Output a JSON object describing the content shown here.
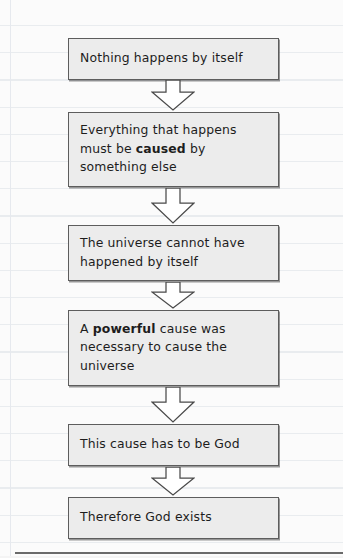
{
  "page": {
    "type": "handwritten-style flowchart on ruled notebook paper",
    "width": 343,
    "height": 558,
    "background_color": "#fbfbfb",
    "rule_line_color": "#e9ecef",
    "margin_line_color": "#e6e9ee",
    "bottom_rule_color": "#6a6a6a"
  },
  "chart_data": {
    "type": "diagram",
    "subtype": "vertical-flowchart",
    "title": "",
    "node_fill": "#ececec",
    "node_border": "#5d5d5d",
    "arrow_fill": "#ffffff",
    "arrow_stroke": "#4a4a4a",
    "nodes": [
      {
        "id": "n1",
        "text": "Nothing happens by itself",
        "segments": [
          {
            "text": "Nothing happens by itself",
            "bold": false
          }
        ],
        "x": 68,
        "y": 38,
        "width": 211,
        "height": 42
      },
      {
        "id": "n2",
        "text": "Everything that happens must be caused by something else",
        "segments": [
          {
            "text": "Everything that happens\nmust be ",
            "bold": false
          },
          {
            "text": "caused",
            "bold": true
          },
          {
            "text": " by\nsomething else",
            "bold": false
          }
        ],
        "x": 68,
        "y": 112,
        "width": 211,
        "height": 75
      },
      {
        "id": "n3",
        "text": "The universe cannot have happened by itself",
        "segments": [
          {
            "text": "The universe cannot have\nhappened by itself",
            "bold": false
          }
        ],
        "x": 68,
        "y": 225,
        "width": 211,
        "height": 56
      },
      {
        "id": "n4",
        "text": "A powerful cause was necessary to cause the universe",
        "segments": [
          {
            "text": "A ",
            "bold": false
          },
          {
            "text": "powerful",
            "bold": true
          },
          {
            "text": " cause was\nnecessary to cause the\nuniverse",
            "bold": false
          }
        ],
        "x": 68,
        "y": 310,
        "width": 211,
        "height": 76
      },
      {
        "id": "n5",
        "text": "This cause has to be God",
        "segments": [
          {
            "text": "This cause has to be God",
            "bold": false
          }
        ],
        "x": 68,
        "y": 424,
        "width": 211,
        "height": 42
      },
      {
        "id": "n6",
        "text": "Therefore God exists",
        "segments": [
          {
            "text": "Therefore God exists",
            "bold": false
          }
        ],
        "x": 68,
        "y": 497,
        "width": 211,
        "height": 42
      }
    ],
    "arrows": [
      {
        "id": "a1",
        "from": "n1",
        "to": "n2",
        "direction": "down",
        "x": 151,
        "y": 80,
        "width": 44,
        "height": 31
      },
      {
        "id": "a2",
        "from": "n2",
        "to": "n3",
        "direction": "down",
        "x": 151,
        "y": 188,
        "width": 44,
        "height": 36
      },
      {
        "id": "a3",
        "from": "n3",
        "to": "n4",
        "direction": "down",
        "x": 151,
        "y": 282,
        "width": 44,
        "height": 27
      },
      {
        "id": "a4",
        "from": "n4",
        "to": "n5",
        "direction": "down",
        "x": 151,
        "y": 387,
        "width": 44,
        "height": 36
      },
      {
        "id": "a5",
        "from": "n5",
        "to": "n6",
        "direction": "down",
        "x": 151,
        "y": 467,
        "width": 44,
        "height": 29
      }
    ]
  }
}
